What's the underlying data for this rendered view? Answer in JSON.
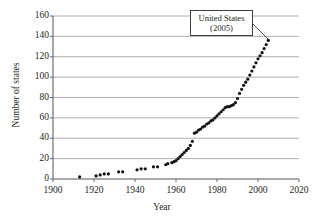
{
  "chart_data": {
    "type": "scatter",
    "title": "",
    "xlabel": "Year",
    "ylabel": "Number of states",
    "xlim": [
      1900,
      2020
    ],
    "ylim": [
      0,
      160
    ],
    "xticks": [
      1900,
      1920,
      1940,
      1960,
      1980,
      2000,
      2020
    ],
    "yticks": [
      0,
      20,
      40,
      60,
      80,
      100,
      120,
      140,
      160
    ],
    "grid": "horizontal",
    "legend": "none",
    "marker_color": "#111111",
    "grid_color": "#999999",
    "axis_color": "#555555",
    "background_color": "#ffffff",
    "annotations": [
      {
        "name": "united-states-callout",
        "line1": "United States",
        "line2": "(2005)",
        "target_x": 2005,
        "target_y": 136
      }
    ],
    "series": [
      {
        "name": "Cumulative number of states",
        "points": [
          [
            1913,
            2
          ],
          [
            1921,
            3
          ],
          [
            1923,
            4
          ],
          [
            1925,
            5
          ],
          [
            1927,
            5
          ],
          [
            1932,
            7
          ],
          [
            1934,
            7
          ],
          [
            1941,
            9
          ],
          [
            1943,
            10
          ],
          [
            1945,
            10
          ],
          [
            1949,
            12
          ],
          [
            1951,
            12
          ],
          [
            1955,
            14
          ],
          [
            1956,
            15
          ],
          [
            1958,
            16
          ],
          [
            1959,
            17
          ],
          [
            1960,
            18
          ],
          [
            1961,
            20
          ],
          [
            1962,
            22
          ],
          [
            1963,
            24
          ],
          [
            1964,
            26
          ],
          [
            1965,
            28
          ],
          [
            1966,
            30
          ],
          [
            1967,
            33
          ],
          [
            1968,
            37
          ],
          [
            1969,
            45
          ],
          [
            1970,
            46
          ],
          [
            1971,
            48
          ],
          [
            1972,
            49
          ],
          [
            1973,
            51
          ],
          [
            1974,
            52
          ],
          [
            1975,
            54
          ],
          [
            1976,
            55
          ],
          [
            1977,
            57
          ],
          [
            1978,
            58
          ],
          [
            1979,
            60
          ],
          [
            1980,
            62
          ],
          [
            1981,
            64
          ],
          [
            1982,
            66
          ],
          [
            1983,
            68
          ],
          [
            1984,
            70
          ],
          [
            1985,
            71
          ],
          [
            1986,
            71
          ],
          [
            1987,
            72
          ],
          [
            1988,
            73
          ],
          [
            1989,
            75
          ],
          [
            1990,
            79
          ],
          [
            1991,
            84
          ],
          [
            1992,
            88
          ],
          [
            1993,
            92
          ],
          [
            1994,
            95
          ],
          [
            1995,
            98
          ],
          [
            1996,
            102
          ],
          [
            1997,
            106
          ],
          [
            1998,
            110
          ],
          [
            1999,
            114
          ],
          [
            2000,
            118
          ],
          [
            2001,
            121
          ],
          [
            2002,
            124
          ],
          [
            2003,
            128
          ],
          [
            2004,
            132
          ],
          [
            2005,
            136
          ]
        ]
      }
    ]
  }
}
